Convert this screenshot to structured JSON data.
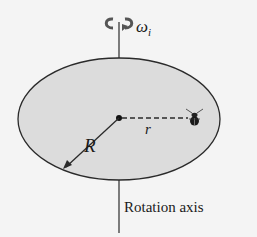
{
  "diagram": {
    "omega_label": "ω",
    "omega_sub": "i",
    "radius_big_label": "R",
    "radius_small_label": "r",
    "axis_label": "Rotation axis",
    "colors": {
      "disk_fill": "#dcdcdc",
      "line": "#2a2a2a",
      "background": "#f4f4f4"
    }
  }
}
